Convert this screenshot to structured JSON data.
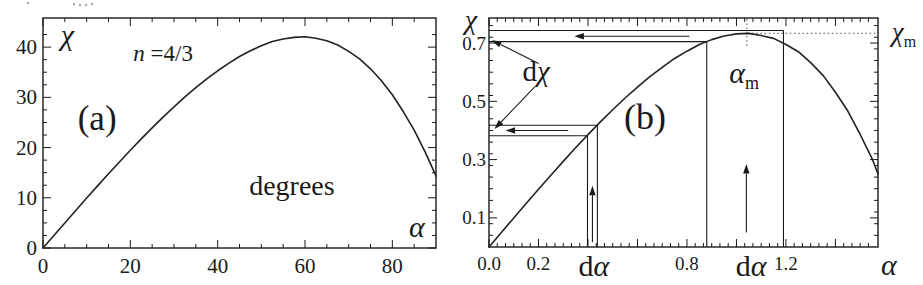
{
  "figure": {
    "panel_labels": [
      "(a)",
      "(b)"
    ],
    "ink_color": "#1a1a1a",
    "dotted_color": "#555555",
    "background": "#ffffff"
  },
  "top_edge_fragments": {
    "dots": [
      [
        28,
        3
      ],
      [
        74,
        4
      ],
      [
        80,
        5
      ],
      [
        86,
        5
      ],
      [
        92,
        4
      ]
    ]
  },
  "chart_data": [
    {
      "id": "a",
      "type": "line",
      "title": "(a)",
      "xlabel": "α",
      "ylabel": "χ",
      "units_annotation": "degrees",
      "refraction_annotation": "n =4/3",
      "xlim": [
        0,
        90
      ],
      "ylim": [
        0,
        45.8
      ],
      "box": {
        "left": 43,
        "top": 18,
        "right": 436,
        "bottom": 248
      },
      "tick_font": 21,
      "label_gap": 6,
      "x_axis": {
        "min": 0,
        "max": 90,
        "minor_step": 5,
        "majors": [
          {
            "v": 0,
            "l": "0"
          },
          {
            "v": 20,
            "l": "20"
          },
          {
            "v": 40,
            "l": "40"
          },
          {
            "v": 60,
            "l": "60"
          },
          {
            "v": 80,
            "l": "80"
          }
        ]
      },
      "y_axis": {
        "min": 0,
        "max": 45.8,
        "minor_step": 2.5,
        "majors": [
          {
            "v": 0,
            "l": "0"
          },
          {
            "v": 10,
            "l": "10"
          },
          {
            "v": 20,
            "l": "20"
          },
          {
            "v": 30,
            "l": "30"
          },
          {
            "v": 40,
            "l": "40"
          }
        ]
      },
      "series": {
        "name": "deflection angle chi vs incidence alpha, n=4/3 (degrees)",
        "x": [
          0,
          2.5,
          5,
          7.5,
          10,
          12.5,
          15,
          17.5,
          20,
          22.5,
          25,
          27.5,
          30,
          32.5,
          35,
          37.5,
          40,
          42.5,
          45,
          47.5,
          50,
          52.5,
          55,
          57.5,
          60,
          62.5,
          65,
          67.5,
          70,
          72.5,
          75,
          77.5,
          80,
          82.5,
          85,
          87.5,
          90
        ],
        "y": [
          0,
          2.5,
          4.99,
          7.47,
          9.94,
          12.37,
          14.78,
          17.14,
          19.45,
          21.72,
          23.91,
          26.07,
          28.1,
          30.08,
          31.92,
          33.67,
          35.29,
          36.77,
          38.13,
          39.27,
          40.26,
          41.11,
          41.63,
          41.95,
          42.07,
          41.78,
          41.26,
          40.42,
          39.15,
          37.66,
          35.68,
          33.3,
          30.51,
          27.17,
          23.47,
          19.14,
          14.36
        ]
      },
      "texts": [
        {
          "x": 5.6,
          "y": 42.5,
          "size": 30,
          "parts": [
            {
              "t": "χ",
              "i": true
            }
          ]
        },
        {
          "x": 27.5,
          "y": 38.8,
          "size": 23,
          "parts": [
            {
              "t": "n",
              "i": true
            },
            {
              "t": " =4/3"
            }
          ]
        },
        {
          "x": 12.4,
          "y": 25.9,
          "size": 35,
          "parts": [
            {
              "t": "(a)"
            }
          ]
        },
        {
          "x": 57.0,
          "y": 12.5,
          "size": 28,
          "parts": [
            {
              "t": "degrees"
            }
          ]
        },
        {
          "x": 85.6,
          "y": 4.2,
          "size": 30,
          "parts": [
            {
              "t": "α",
              "i": true
            }
          ]
        }
      ],
      "lines": [],
      "arrows": []
    },
    {
      "id": "b",
      "type": "line",
      "title": "(b)",
      "xlabel": "α",
      "ylabel": "χ",
      "max_point_labels": {
        "x_max": "αm",
        "y_max": "χm",
        "dx": "dα",
        "dy": "dχ"
      },
      "xlim": [
        0,
        1.572
      ],
      "ylim": [
        0,
        0.786
      ],
      "maximum": {
        "alpha_m": 1.042,
        "chi_m": 0.7336
      },
      "box": {
        "left": 489,
        "top": 18,
        "right": 878,
        "bottom": 247
      },
      "tick_font": 19,
      "label_gap": 3,
      "x_axis": {
        "min": 0,
        "max": 1.572,
        "minor_step": 0.03333,
        "majors": [
          {
            "v": 0,
            "l": "0.0"
          },
          {
            "v": 0.2,
            "l": "0.2"
          },
          {
            "v": 0.4
          },
          {
            "v": 0.6
          },
          {
            "v": 0.8,
            "l": "0.8"
          },
          {
            "v": 1.0
          },
          {
            "v": 1.2,
            "l": "1.2"
          },
          {
            "v": 1.4
          }
        ]
      },
      "y_axis": {
        "min": 0,
        "max": 0.786,
        "minor_step": 0.04,
        "majors": [
          {
            "v": 0.1,
            "l": "0.1"
          },
          {
            "v": 0.3,
            "l": "0.3"
          },
          {
            "v": 0.5,
            "l": "0.5"
          },
          {
            "v": 0.7,
            "l": "0.7"
          }
        ]
      },
      "series": {
        "name": "deflection angle chi vs incidence alpha, n=4/3 (radians)",
        "x": [
          0,
          0.05,
          0.1,
          0.15,
          0.2,
          0.25,
          0.3,
          0.35,
          0.4,
          0.45,
          0.5,
          0.55,
          0.6,
          0.65,
          0.7,
          0.75,
          0.8,
          0.85,
          0.9,
          0.95,
          1.0,
          1.05,
          1.1,
          1.15,
          1.2,
          1.25,
          1.3,
          1.35,
          1.4,
          1.45,
          1.5,
          1.55,
          1.572
        ],
        "y": [
          0,
          0.05,
          0.0998,
          0.1493,
          0.1982,
          0.2465,
          0.294,
          0.3404,
          0.3857,
          0.4293,
          0.4711,
          0.5114,
          0.5489,
          0.5845,
          0.6166,
          0.6471,
          0.6721,
          0.6948,
          0.7118,
          0.7245,
          0.7316,
          0.7331,
          0.7257,
          0.7161,
          0.6949,
          0.6703,
          0.6328,
          0.5891,
          0.5313,
          0.4666,
          0.3862,
          0.2996,
          0.2507
        ]
      },
      "texts": [
        {
          "x": -0.073,
          "y": 0.783,
          "size": 28,
          "parts": [
            {
              "t": "χ",
              "i": true
            }
          ]
        },
        {
          "x": 0.19,
          "y": 0.604,
          "size": 29,
          "parts": [
            {
              "t": "d"
            },
            {
              "t": "χ",
              "i": true
            }
          ]
        },
        {
          "x": 0.63,
          "y": 0.447,
          "size": 36,
          "parts": [
            {
              "t": "(b)"
            }
          ]
        },
        {
          "x": 1.031,
          "y": 0.598,
          "size": 30,
          "parts": [
            {
              "t": "α",
              "i": true
            },
            {
              "t": "m",
              "sub": true
            }
          ]
        },
        {
          "x": 1.677,
          "y": 0.738,
          "size": 27,
          "parts": [
            {
              "t": "χ",
              "i": true
            },
            {
              "t": "m",
              "sub": true
            }
          ]
        },
        {
          "x": 1.616,
          "y": -0.061,
          "size": 30,
          "parts": [
            {
              "t": "α",
              "i": true
            }
          ]
        },
        {
          "x": 0.424,
          "y": -0.065,
          "size": 30,
          "parts": [
            {
              "t": "d"
            },
            {
              "t": "α",
              "i": true
            }
          ]
        },
        {
          "x": 1.059,
          "y": -0.065,
          "size": 30,
          "parts": [
            {
              "t": "d"
            },
            {
              "t": "α",
              "i": true
            }
          ]
        }
      ],
      "lines": [
        {
          "x1": 0,
          "y1": 0.743,
          "x2": 1.19,
          "y2": 0.743
        },
        {
          "x1": 0,
          "y1": 0.705,
          "x2": 0.88,
          "y2": 0.705
        },
        {
          "x1": 0,
          "y1": 0.418,
          "x2": 0.438,
          "y2": 0.418
        },
        {
          "x1": 0,
          "y1": 0.382,
          "x2": 0.398,
          "y2": 0.382
        },
        {
          "x1": 0.398,
          "y1": 0,
          "x2": 0.398,
          "y2": 0.382
        },
        {
          "x1": 0.438,
          "y1": 0,
          "x2": 0.438,
          "y2": 0.418
        },
        {
          "x1": 0.88,
          "y1": 0,
          "x2": 0.88,
          "y2": 0.705
        },
        {
          "x1": 1.19,
          "y1": 0,
          "x2": 1.19,
          "y2": 0.743
        },
        {
          "x1": 1.042,
          "y1": 0.69,
          "x2": 1.042,
          "y2": 0.786,
          "dot": true
        },
        {
          "x1": 1.046,
          "y1": 0.7336,
          "x2": 1.572,
          "y2": 0.7336,
          "dot": true
        }
      ],
      "arrows": [
        {
          "x1": 0.81,
          "y1": 0.7235,
          "x2": 0.345,
          "y2": 0.7235
        },
        {
          "x1": 0.32,
          "y1": 0.4,
          "x2": 0.067,
          "y2": 0.4
        },
        {
          "x1": 0.418,
          "y1": 0.016,
          "x2": 0.418,
          "y2": 0.21
        },
        {
          "x1": 1.04,
          "y1": 0.05,
          "x2": 1.04,
          "y2": 0.285
        },
        {
          "x1": 0.2,
          "y1": 0.63,
          "x2": 0.012,
          "y2": 0.71
        },
        {
          "x1": 0.185,
          "y1": 0.55,
          "x2": 0.022,
          "y2": 0.405
        }
      ]
    }
  ]
}
